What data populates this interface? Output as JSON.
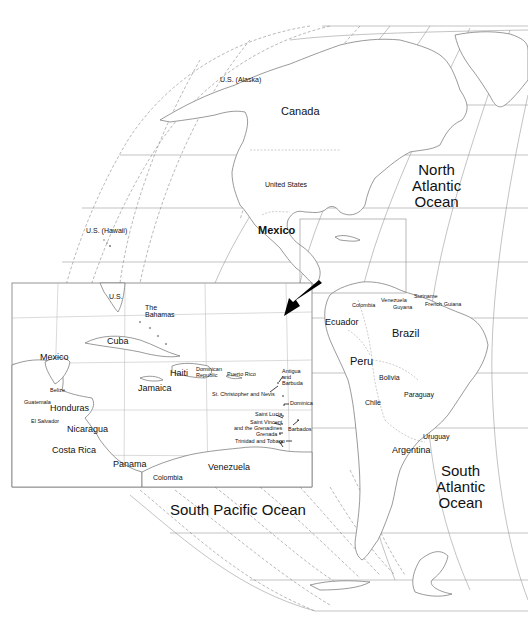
{
  "map": {
    "title": "Western Hemisphere political map with Caribbean inset",
    "projection": "globe-like oblique projection with graticule",
    "colors": {
      "background": "#ffffff",
      "coastline": "#6e6e6e",
      "graticule": "#9a9a9a",
      "text": "#111111",
      "arrow": "#000000"
    },
    "oceans": [
      {
        "id": "north-atlantic",
        "label": "North\nAtlantic\nOcean",
        "x": 412,
        "y": 162
      },
      {
        "id": "south-atlantic",
        "label": "South\nAtlantic\nOcean",
        "x": 436,
        "y": 463
      },
      {
        "id": "south-pacific",
        "label": "South Pacific Ocean",
        "x": 170,
        "y": 502
      }
    ],
    "main_labels": [
      {
        "id": "us-alaska",
        "label": "U.S. (Alaska)",
        "x": 220,
        "y": 76,
        "size": "sm"
      },
      {
        "id": "canada",
        "label": "Canada",
        "x": 281,
        "y": 106,
        "size": "lg"
      },
      {
        "id": "united-states",
        "label": "United States",
        "x": 265,
        "y": 181,
        "size": "sm"
      },
      {
        "id": "us-hawaii",
        "label": "U.S. (Hawaii)",
        "x": 86,
        "y": 227,
        "size": "sm"
      },
      {
        "id": "mexico",
        "label": "Mexico",
        "x": 258,
        "y": 225,
        "size": "lg"
      },
      {
        "id": "colombia-main",
        "label": "Colombia",
        "x": 352,
        "y": 303,
        "size": "xs"
      },
      {
        "id": "venezuela-main",
        "label": "Venezuela",
        "x": 381,
        "y": 299,
        "size": "xs"
      },
      {
        "id": "guyana",
        "label": "Guyana",
        "x": 393,
        "y": 306,
        "size": "xs"
      },
      {
        "id": "suriname",
        "label": "Suriname",
        "x": 414,
        "y": 295,
        "size": "xs"
      },
      {
        "id": "french-guiana",
        "label": "French Guiana",
        "x": 425,
        "y": 303,
        "size": "xs"
      },
      {
        "id": "ecuador",
        "label": "Ecuador",
        "x": 325,
        "y": 318,
        "size": "md"
      },
      {
        "id": "brazil",
        "label": "Brazil",
        "x": 392,
        "y": 328,
        "size": "lg"
      },
      {
        "id": "peru",
        "label": "Peru",
        "x": 350,
        "y": 356,
        "size": "lg"
      },
      {
        "id": "bolivia",
        "label": "Bolivia",
        "x": 379,
        "y": 374,
        "size": "sm"
      },
      {
        "id": "paraguay",
        "label": "Paraguay",
        "x": 404,
        "y": 391,
        "size": "sm"
      },
      {
        "id": "chile",
        "label": "Chile",
        "x": 365,
        "y": 399,
        "size": "sm"
      },
      {
        "id": "uruguay",
        "label": "Uruguay",
        "x": 423,
        "y": 433,
        "size": "sm"
      },
      {
        "id": "argentina",
        "label": "Argentina",
        "x": 392,
        "y": 447,
        "size": "md"
      }
    ],
    "inset": {
      "title": "Caribbean detail",
      "frame": {
        "x": 12,
        "y": 283,
        "w": 300,
        "h": 204
      },
      "source_box": {
        "x": 300,
        "y": 219,
        "w": 106,
        "h": 74
      },
      "labels": [
        {
          "id": "us",
          "label": "U.S.",
          "x": 109,
          "y": 293,
          "size": "sm"
        },
        {
          "id": "the-bahamas",
          "label": "The\nBahamas",
          "x": 145,
          "y": 304,
          "size": "sm",
          "multi": true
        },
        {
          "id": "cuba",
          "label": "Cuba",
          "x": 107,
          "y": 337,
          "size": "md"
        },
        {
          "id": "mexico-inset",
          "label": "Mexico",
          "x": 40,
          "y": 353,
          "size": "md"
        },
        {
          "id": "haiti",
          "label": "Haiti",
          "x": 170,
          "y": 369,
          "size": "md"
        },
        {
          "id": "dominican-republic",
          "label": "Dominican\nRepublic",
          "x": 196,
          "y": 367,
          "size": "xs",
          "multi": true
        },
        {
          "id": "puerto-rico",
          "label": "Puerto Rico",
          "x": 227,
          "y": 372,
          "size": "xs"
        },
        {
          "id": "antigua-and-barbuda",
          "label": "Antigua\nand\nBarbuda",
          "x": 282,
          "y": 369,
          "size": "xs",
          "multi": true
        },
        {
          "id": "jamaica",
          "label": "Jamaica",
          "x": 138,
          "y": 384,
          "size": "md"
        },
        {
          "id": "st-christopher-and-nevis",
          "label": "St. Christopher and Nevis",
          "x": 212,
          "y": 392,
          "size": "xs"
        },
        {
          "id": "belize",
          "label": "Belize",
          "x": 50,
          "y": 388,
          "size": "xs"
        },
        {
          "id": "guatemala",
          "label": "Guatemala",
          "x": 24,
          "y": 400,
          "size": "xs"
        },
        {
          "id": "dominica",
          "label": "Dominica",
          "x": 290,
          "y": 403,
          "size": "xs"
        },
        {
          "id": "honduras",
          "label": "Honduras",
          "x": 50,
          "y": 404,
          "size": "md"
        },
        {
          "id": "saint-lucia",
          "label": "Saint Lucia",
          "x": 255,
          "y": 414,
          "size": "xs"
        },
        {
          "id": "el-salvador",
          "label": "El Salvador",
          "x": 31,
          "y": 419,
          "size": "xs"
        },
        {
          "id": "saint-vincent",
          "label": "Saint Vincent\nand the Grenadines",
          "x": 234,
          "y": 421,
          "size": "xs",
          "multi": true,
          "align": "right"
        },
        {
          "id": "barbados",
          "label": "Barbados",
          "x": 288,
          "y": 428,
          "size": "xs"
        },
        {
          "id": "nicaragua",
          "label": "Nicaragua",
          "x": 67,
          "y": 425,
          "size": "md"
        },
        {
          "id": "grenada",
          "label": "Grenada",
          "x": 256,
          "y": 433,
          "size": "xs"
        },
        {
          "id": "trinidad-and-tobago",
          "label": "Trinidad and Tobago",
          "x": 235,
          "y": 441,
          "size": "xs"
        },
        {
          "id": "costa-rica",
          "label": "Costa Rica",
          "x": 52,
          "y": 447,
          "size": "md"
        },
        {
          "id": "panama",
          "label": "Panama",
          "x": 113,
          "y": 461,
          "size": "md"
        },
        {
          "id": "venezuela-inset",
          "label": "Venezuela",
          "x": 208,
          "y": 464,
          "size": "md"
        },
        {
          "id": "colombia-inset",
          "label": "Colombia",
          "x": 153,
          "y": 474,
          "size": "sm"
        }
      ]
    },
    "arrow": {
      "from": [
        322,
        284
      ],
      "to": [
        284,
        316
      ],
      "meaning": "points from source box to inset"
    }
  }
}
